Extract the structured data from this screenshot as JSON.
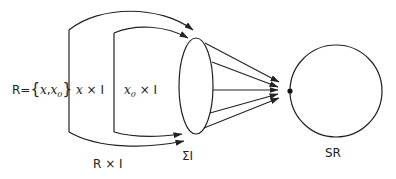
{
  "labels": {
    "r_prefix": "R=",
    "r_set_open": "{",
    "r_set_x": "x",
    "r_set_comma": ",",
    "r_set_x0": "x",
    "r_set_x0_sub": "0",
    "r_set_close": "}",
    "x_times_i_x": "x",
    "x_times_i_rest": " × I",
    "x0_times_i_x": "x",
    "x0_times_i_sub": "0",
    "x0_times_i_rest": " × I",
    "r_times_i": "R × I",
    "sigma_i": "ΣI",
    "sr": "SR"
  },
  "colors": {
    "stroke": "#222222",
    "background": "#ffffff"
  }
}
